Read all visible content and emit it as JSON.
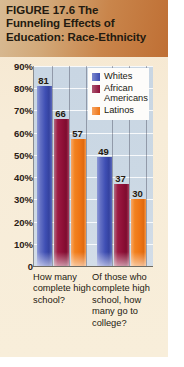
{
  "figure": {
    "number": "FIGURE 17.6",
    "title_line1_rest": "The",
    "title_line2": "Funneling Effects of",
    "title_line3": "Education: Race-Ethnicity"
  },
  "legend": {
    "position": "inside-top-right",
    "items": [
      {
        "label": "Whites",
        "color": "#3f4fb4"
      },
      {
        "label": "African\nAmericans",
        "color": "#8d0f36"
      },
      {
        "label": "Latinos",
        "color": "#ee7414"
      }
    ]
  },
  "chart_data": {
    "type": "bar",
    "title": "FIGURE 17.6  The Funneling Effects of Education: Race-Ethnicity",
    "categories": [
      "How many complete high school?",
      "Of those who complete high school, how many go to college?"
    ],
    "series": [
      {
        "name": "Whites",
        "color": "#3f4fb4",
        "values": [
          81,
          49
        ]
      },
      {
        "name": "African Americans",
        "color": "#8d0f36",
        "values": [
          66,
          37
        ]
      },
      {
        "name": "Latinos",
        "color": "#ee7414",
        "values": [
          57,
          30
        ]
      }
    ],
    "xlabel": "",
    "ylabel": "",
    "ylim": [
      0,
      90
    ],
    "yticks": [
      0,
      10,
      20,
      30,
      40,
      50,
      60,
      70,
      80,
      90
    ],
    "ytick_labels": [
      "0",
      "10%",
      "20%",
      "30%",
      "40%",
      "50%",
      "60%",
      "70%",
      "80%",
      "90%"
    ],
    "grid": true,
    "value_labels": [
      81,
      66,
      57,
      49,
      37,
      30
    ]
  }
}
